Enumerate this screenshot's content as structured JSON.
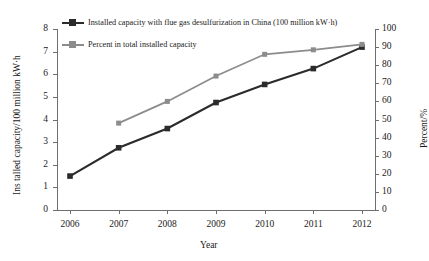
{
  "chart_data": {
    "type": "line",
    "title": "",
    "xlabel": "Year",
    "ylabel": "Ins talled capacity/100 million kW·h",
    "y2label": "Percent/%",
    "categories": [
      "2006",
      "2007",
      "2008",
      "2009",
      "2010",
      "2011",
      "2012"
    ],
    "ylim": [
      0,
      8
    ],
    "y2lim": [
      0,
      100
    ],
    "yticks": [
      "0",
      "1",
      "2",
      "3",
      "4",
      "5",
      "6",
      "7",
      "8"
    ],
    "y2ticks": [
      "0",
      "10",
      "20",
      "30",
      "40",
      "50",
      "60",
      "70",
      "80",
      "90",
      "100"
    ],
    "grid": false,
    "legend_position": "top-left",
    "series": [
      {
        "name": "Installed capacity with flue gas desulfurization in China (100 million kW·h)",
        "axis": "left",
        "color": "#2b2b2b",
        "marker": "square",
        "values": [
          1.5,
          2.75,
          3.6,
          4.75,
          5.55,
          6.25,
          7.2
        ]
      },
      {
        "name": "Percent in total installed capacity",
        "axis": "right",
        "color": "#8c8c8c",
        "marker": "square",
        "values": [
          null,
          48,
          60,
          74,
          86,
          88.5,
          91.5
        ]
      }
    ]
  }
}
